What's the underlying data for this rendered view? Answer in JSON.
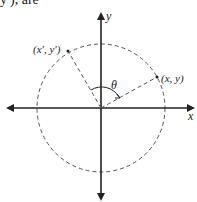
{
  "top_text": "y′), are",
  "labels": {
    "y_axis": "y",
    "x_axis": "x",
    "point_original": "(x, y)",
    "point_rotated": "(x′, y′)",
    "angle": "θ"
  },
  "colors": {
    "stroke": "#222222",
    "dashed": "#555555"
  }
}
